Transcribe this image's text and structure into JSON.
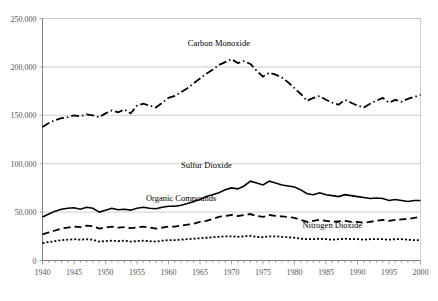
{
  "chart_data": {
    "type": "line",
    "title": "",
    "xlabel": "",
    "ylabel": "",
    "xlim": [
      1940,
      2000
    ],
    "ylim": [
      0,
      250000
    ],
    "grid": true,
    "legend_position": "inline-annotations",
    "y_ticks": [
      0,
      50000,
      100000,
      150000,
      200000,
      250000
    ],
    "y_tick_labels": [
      "0",
      "50,000",
      "100,000",
      "150,000",
      "200,000",
      "250,000"
    ],
    "x_ticks": [
      1940,
      1945,
      1950,
      1955,
      1960,
      1965,
      1970,
      1975,
      1980,
      1985,
      1990,
      1995,
      2000
    ],
    "x_tick_labels": [
      "1940",
      "1945",
      "1950",
      "1955",
      "1960",
      "1965",
      "1970",
      "1975",
      "1980",
      "1985",
      "1990",
      "1995",
      "2000"
    ],
    "x_minor_tick_step": 1,
    "x": [
      1940,
      1941,
      1942,
      1943,
      1944,
      1945,
      1946,
      1947,
      1948,
      1949,
      1950,
      1951,
      1952,
      1953,
      1954,
      1955,
      1956,
      1957,
      1958,
      1959,
      1960,
      1961,
      1962,
      1963,
      1964,
      1965,
      1966,
      1967,
      1968,
      1969,
      1970,
      1971,
      1972,
      1973,
      1974,
      1975,
      1976,
      1977,
      1978,
      1979,
      1980,
      1981,
      1982,
      1983,
      1984,
      1985,
      1986,
      1987,
      1988,
      1989,
      1990,
      1991,
      1992,
      1993,
      1994,
      1995,
      1996,
      1997,
      1998,
      1999,
      2000
    ],
    "series": [
      {
        "name": "Carbon Monoxide",
        "label": "Carbon Monoxide",
        "line_style": "dash-dot",
        "color": "#000000",
        "label_x": 1968,
        "label_y": 222000,
        "values": [
          138000,
          142000,
          145000,
          147000,
          148000,
          150000,
          149000,
          151000,
          150000,
          148000,
          152000,
          155000,
          153000,
          156000,
          152000,
          160000,
          162000,
          160000,
          158000,
          163000,
          168000,
          170000,
          174000,
          178000,
          183000,
          188000,
          193000,
          197000,
          202000,
          205000,
          208000,
          204000,
          206000,
          203000,
          196000,
          190000,
          194000,
          192000,
          189000,
          184000,
          178000,
          172000,
          165000,
          168000,
          170000,
          166000,
          163000,
          161000,
          166000,
          163000,
          160000,
          158000,
          162000,
          165000,
          168000,
          163000,
          166000,
          164000,
          167000,
          169000,
          171000
        ]
      },
      {
        "name": "Sulfur Dioxide",
        "label": "Sulfur Dioxide",
        "line_style": "solid",
        "color": "#000000",
        "label_x": 1966,
        "label_y": 96000,
        "values": [
          45000,
          48000,
          51000,
          53000,
          54000,
          54500,
          53000,
          55000,
          54000,
          50000,
          52000,
          54000,
          52500,
          53000,
          52000,
          54000,
          55000,
          54000,
          53500,
          55000,
          56000,
          56000,
          57000,
          59000,
          61000,
          63000,
          66000,
          68000,
          70000,
          73000,
          75000,
          74000,
          77000,
          82000,
          80000,
          78000,
          82000,
          80000,
          78000,
          77000,
          76000,
          73000,
          69000,
          68000,
          70000,
          68000,
          67000,
          66000,
          68000,
          67000,
          66000,
          65000,
          64000,
          64500,
          64000,
          62000,
          63000,
          62000,
          61000,
          62000,
          62000
        ]
      },
      {
        "name": "Organic Compounds",
        "label": "Organic Compounds",
        "line_style": "dashed",
        "color": "#000000",
        "label_x": 1962,
        "label_y": 61000,
        "values": [
          27000,
          29000,
          31000,
          33000,
          34000,
          35000,
          34500,
          36000,
          35500,
          33000,
          34000,
          35000,
          34000,
          34500,
          33500,
          34000,
          35000,
          34000,
          33000,
          34000,
          35000,
          35000,
          36000,
          37000,
          38000,
          40000,
          41000,
          43000,
          45000,
          46000,
          47000,
          46000,
          47000,
          48000,
          46000,
          45000,
          47000,
          46000,
          45500,
          45000,
          44000,
          42000,
          40000,
          41000,
          42000,
          41000,
          40000,
          40500,
          41000,
          40000,
          40000,
          39000,
          40000,
          41000,
          42000,
          41000,
          42000,
          42500,
          43000,
          44000,
          45000
        ]
      },
      {
        "name": "Nitrogen Dioxide",
        "label": "Nitrogen Dioxide",
        "line_style": "dotted",
        "color": "#000000",
        "label_x": 1986,
        "label_y": 34000,
        "values": [
          18000,
          19000,
          20000,
          21000,
          21500,
          22000,
          21500,
          22000,
          21500,
          19500,
          20000,
          20500,
          20000,
          20500,
          19500,
          20000,
          20500,
          20000,
          19500,
          20500,
          21000,
          21000,
          21500,
          22000,
          22500,
          23000,
          23500,
          24000,
          24500,
          25000,
          25000,
          24500,
          25000,
          25500,
          24500,
          24000,
          25000,
          25000,
          24500,
          24000,
          23500,
          22500,
          22000,
          22000,
          22500,
          22000,
          21500,
          22000,
          22500,
          22000,
          22000,
          21500,
          22000,
          22000,
          22000,
          21500,
          22000,
          22000,
          21500,
          21000,
          21000
        ]
      }
    ]
  }
}
